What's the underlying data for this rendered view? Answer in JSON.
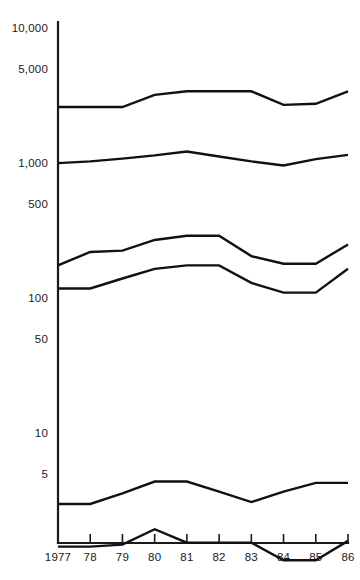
{
  "chart_data": {
    "type": "line",
    "title": "",
    "subtitle": "",
    "xlabel": "",
    "ylabel": "",
    "yscale": "log",
    "grid": false,
    "legend": false,
    "legend_position": "none",
    "x": [
      1977,
      1978,
      1979,
      1980,
      1981,
      1982,
      1983,
      1984,
      1985,
      1986
    ],
    "x_tick_labels": [
      "1977",
      "78",
      "79",
      "80",
      "81",
      "82",
      "83",
      "84",
      "85",
      "86"
    ],
    "y_tick_labels": [
      "10,000",
      "5,000",
      "1,000",
      "500",
      "100",
      "50",
      "10",
      "5"
    ],
    "y_tick_values": [
      10000,
      5000,
      1000,
      500,
      100,
      50,
      10,
      5
    ],
    "ylim": [
      1,
      16000
    ],
    "series": [
      {
        "name": "series-1",
        "values": [
          2600,
          2600,
          2600,
          3200,
          3400,
          3400,
          3400,
          2700,
          2750,
          3400
        ]
      },
      {
        "name": "series-2",
        "values": [
          1000,
          1030,
          1080,
          1140,
          1220,
          1120,
          1030,
          960,
          1070,
          1150
        ]
      },
      {
        "name": "series-3",
        "values": [
          175,
          220,
          225,
          270,
          290,
          290,
          205,
          180,
          180,
          250
        ]
      },
      {
        "name": "series-4",
        "values": [
          118,
          118,
          140,
          165,
          175,
          175,
          130,
          110,
          110,
          165
        ]
      },
      {
        "name": "series-5",
        "values": [
          3.0,
          3.0,
          3.6,
          4.4,
          4.4,
          3.7,
          3.1,
          3.7,
          4.3,
          4.3
        ]
      },
      {
        "name": "series-6",
        "values": [
          1.45,
          1.45,
          1.5,
          1.95,
          1.55,
          1.55,
          1.55,
          1.15,
          1.15,
          1.6
        ]
      }
    ]
  },
  "axis": {
    "y_axis_name": "y-axis",
    "x_axis_name": "x-axis"
  }
}
